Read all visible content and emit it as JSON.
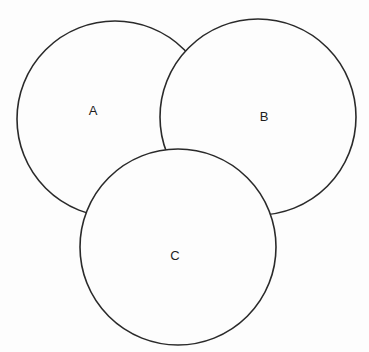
{
  "diagram": {
    "type": "venn",
    "background": "#fdfdfd",
    "stroke_color": "#2a2a2a",
    "sets": [
      {
        "id": "A",
        "label": "A",
        "cx": 115,
        "cy": 119,
        "r": 98,
        "label_x": 93,
        "label_y": 110,
        "layer": 1
      },
      {
        "id": "B",
        "label": "B",
        "cx": 258,
        "cy": 117,
        "r": 98,
        "label_x": 264,
        "label_y": 116,
        "layer": 2
      },
      {
        "id": "C",
        "label": "C",
        "cx": 178,
        "cy": 247,
        "r": 98,
        "label_x": 175,
        "label_y": 255,
        "layer": 3
      }
    ]
  }
}
